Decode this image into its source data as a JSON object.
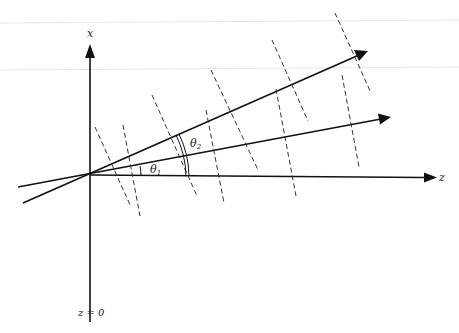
{
  "diagram": {
    "type": "wave-vector schematic",
    "axes": {
      "x_label": "x",
      "z_label": "z",
      "origin_label": "z = 0"
    },
    "angles": {
      "theta1": "θ",
      "theta1_sub": "1",
      "theta2": "θ",
      "theta2_sub": "2"
    },
    "beams": [
      {
        "name": "beam-1",
        "angle_label": "θ1"
      },
      {
        "name": "beam-2",
        "angle_label": "θ2"
      }
    ],
    "colors": {
      "line": "#111111",
      "guide": "#e4e4e4",
      "dashed": "#333333"
    }
  }
}
